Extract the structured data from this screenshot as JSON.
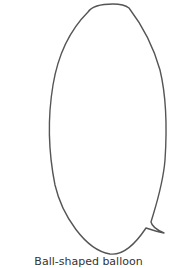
{
  "figure": {
    "shape": "speech-bubble-outline",
    "stroke_color": "#555555",
    "fill_color": "#ffffff",
    "tail_direction": "bottom-right"
  },
  "caption": {
    "text": "Ball-shaped balloon"
  }
}
